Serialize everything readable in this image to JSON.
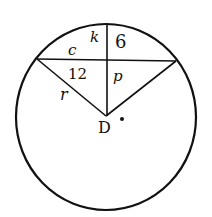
{
  "diagram": {
    "type": "circle-chord-geometry",
    "labels": {
      "k": "k",
      "six": "6",
      "c": "c",
      "twelve": "12",
      "p": "p",
      "r": "r",
      "center": "D"
    },
    "colors": {
      "stroke": "#111111",
      "background": "#ffffff"
    },
    "shapes": {
      "circle": {
        "cx": 106,
        "cy": 117,
        "rx": 90,
        "ry": 93
      },
      "chord": {
        "x1": 37,
        "y1": 59,
        "x2": 176,
        "y2": 61
      },
      "vertical_segment": {
        "x1": 107,
        "y1": 24,
        "x2": 107,
        "y2": 116
      },
      "radius_left": {
        "x1": 37,
        "y1": 59,
        "x2": 106,
        "y2": 116
      },
      "radius_right": {
        "x1": 176,
        "y1": 61,
        "x2": 106,
        "y2": 116
      },
      "center_dot": {
        "cx": 122,
        "cy": 119
      }
    }
  }
}
